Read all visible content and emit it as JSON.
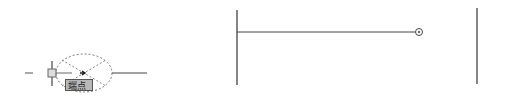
{
  "left_panel": {
    "snap_tooltip": "端点",
    "snap_type": "endpoint-snap-marker"
  },
  "right_panel": {
    "marker": "circle-endpoint-marker"
  },
  "colors": {
    "line": "#333333",
    "dashed": "#777777",
    "tooltip_bg": "#b8b8b8"
  }
}
